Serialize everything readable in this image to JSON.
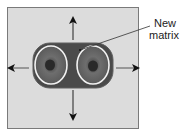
{
  "diagram": {
    "title": "",
    "label": {
      "line1": "New",
      "line2": "matrix"
    },
    "colors": {
      "background": "#ffffff",
      "panel": "#dcdcdc",
      "panel_border": "#7a7a7a",
      "matrix_body": "#4a4a4a",
      "cell_ring": "#f2f2f2",
      "cell_outer": "#6a6a6a",
      "nucleus": "#2a2a2a",
      "arrow": "#111111"
    },
    "arrows": [
      "up",
      "down",
      "left",
      "right"
    ],
    "cells": 2
  }
}
